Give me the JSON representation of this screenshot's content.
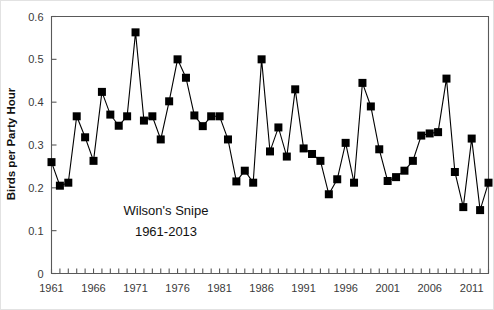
{
  "chart_data": {
    "type": "line",
    "title": "",
    "annotation_lines": [
      "Wilson's Snipe",
      "1961-2013"
    ],
    "xlabel": "",
    "ylabel": "Birds per Party Hour",
    "ylim": [
      0,
      0.6
    ],
    "xlim": [
      1961,
      2013
    ],
    "ytick_labels": [
      "0.6",
      "0.5",
      "0.4",
      "0.3",
      "0.2",
      "0.1",
      "0"
    ],
    "ytick_values": [
      0.6,
      0.5,
      0.4,
      0.3,
      0.2,
      0.1,
      0
    ],
    "xtick_labels": [
      "1961",
      "1966",
      "1971",
      "1976",
      "1981",
      "1986",
      "1991",
      "1996",
      "2001",
      "2006",
      "2011"
    ],
    "xtick_values": [
      1961,
      1966,
      1971,
      1976,
      1981,
      1986,
      1991,
      1996,
      2001,
      2006,
      2011
    ],
    "minor_xticks_every": 1,
    "grid": false,
    "legend": false,
    "marker": "square",
    "marker_color": "#000000",
    "line_color": "#000000",
    "x": [
      1961,
      1962,
      1963,
      1964,
      1965,
      1966,
      1967,
      1968,
      1969,
      1970,
      1971,
      1972,
      1973,
      1974,
      1975,
      1976,
      1977,
      1978,
      1979,
      1980,
      1981,
      1982,
      1983,
      1984,
      1985,
      1986,
      1987,
      1988,
      1989,
      1990,
      1991,
      1992,
      1993,
      1994,
      1995,
      1996,
      1997,
      1998,
      1999,
      2000,
      2001,
      2002,
      2003,
      2004,
      2005,
      2006,
      2007,
      2008,
      2009,
      2010,
      2011,
      2012,
      2013
    ],
    "y": [
      0.26,
      0.205,
      0.212,
      0.367,
      0.318,
      0.263,
      0.424,
      0.371,
      0.345,
      0.367,
      0.563,
      0.357,
      0.367,
      0.313,
      0.402,
      0.5,
      0.457,
      0.369,
      0.344,
      0.367,
      0.367,
      0.313,
      0.215,
      0.24,
      0.212,
      0.5,
      0.285,
      0.341,
      0.273,
      0.43,
      0.292,
      0.279,
      0.263,
      0.185,
      0.22,
      0.305,
      0.212,
      0.445,
      0.39,
      0.29,
      0.216,
      0.225,
      0.24,
      0.263,
      0.322,
      0.327,
      0.33,
      0.455,
      0.237,
      0.155,
      0.315,
      0.148,
      0.212
    ]
  },
  "axes": {
    "ylabel_text": "Birds per Party Hour"
  }
}
